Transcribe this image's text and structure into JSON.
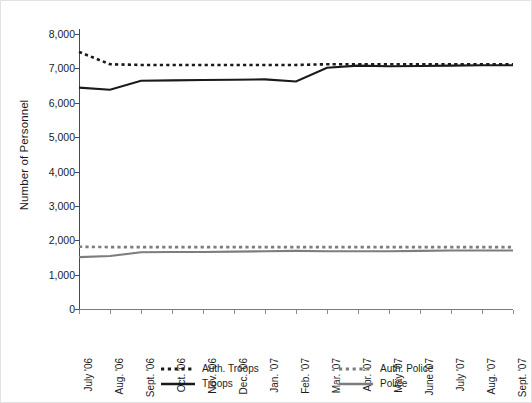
{
  "chart_data": {
    "type": "line",
    "title": "",
    "xlabel": "",
    "ylabel": "Number of Personnel",
    "ylim": [
      0,
      8000
    ],
    "ytick_labels": [
      "0",
      "1,000",
      "2,000",
      "3,000",
      "4,000",
      "5,000",
      "6,000",
      "7,000",
      "8,000"
    ],
    "ytick_values": [
      0,
      1000,
      2000,
      3000,
      4000,
      5000,
      6000,
      7000,
      8000
    ],
    "grid": false,
    "legend_position": "bottom",
    "categories": [
      "July '06",
      "Aug. '06",
      "Sept. '06",
      "Oct. '06",
      "Nov. '06",
      "Dec. '06",
      "Jan. '07",
      "Feb. '07",
      "Mar. '07",
      "Apr. '07",
      "May '07",
      "June '07",
      "July '07",
      "Aug. '07",
      "Sept. '07"
    ],
    "series": [
      {
        "name": "Auth. Troops",
        "style": "dotted",
        "color": "#1a1a1a",
        "values": [
          7480,
          7120,
          7100,
          7100,
          7100,
          7100,
          7100,
          7100,
          7120,
          7120,
          7120,
          7120,
          7120,
          7120,
          7120
        ]
      },
      {
        "name": "Troops",
        "style": "solid",
        "color": "#1a1a1a",
        "values": [
          6440,
          6380,
          6640,
          6650,
          6660,
          6670,
          6680,
          6620,
          7020,
          7080,
          7060,
          7070,
          7080,
          7090,
          7090
        ]
      },
      {
        "name": "Auth. Police",
        "style": "dotted",
        "color": "#7d7d7d",
        "values": [
          1810,
          1800,
          1800,
          1800,
          1800,
          1800,
          1800,
          1800,
          1800,
          1800,
          1800,
          1800,
          1800,
          1800,
          1800
        ]
      },
      {
        "name": "Police",
        "style": "solid",
        "color": "#7d7d7d",
        "values": [
          1510,
          1540,
          1650,
          1660,
          1660,
          1670,
          1680,
          1690,
          1680,
          1680,
          1680,
          1690,
          1700,
          1700,
          1700
        ]
      }
    ]
  },
  "legend": {
    "entries": [
      {
        "label": "Auth. Troops",
        "swatch": "dotted-black-line-icon"
      },
      {
        "label": "Auth. Police",
        "swatch": "dotted-gray-line-icon"
      },
      {
        "label": "Troops",
        "swatch": "solid-black-line-icon"
      },
      {
        "label": "Police",
        "swatch": "solid-gray-line-icon"
      }
    ]
  },
  "colors": {
    "troops": "#1a1a1a",
    "police": "#7d7d7d",
    "axis": "#4a4a4a",
    "background": "#ffffff",
    "border": "#e2e2e2"
  }
}
